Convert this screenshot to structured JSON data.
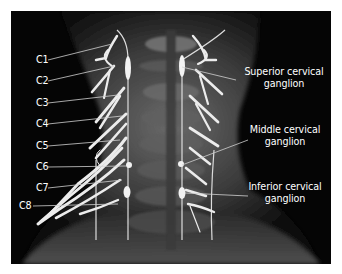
{
  "figure": {
    "panel_background": "#050505",
    "nerve_color": "#e8e8e8",
    "leader_color": "#d0d0d0",
    "label_color": "#ffffff"
  },
  "left_labels": [
    {
      "text": "C1",
      "x": 36,
      "y": 54,
      "line": [
        48,
        60,
        112,
        44
      ]
    },
    {
      "text": "C2",
      "x": 36,
      "y": 75,
      "line": [
        48,
        81,
        114,
        66
      ]
    },
    {
      "text": "C3",
      "x": 36,
      "y": 97,
      "line": [
        48,
        103,
        118,
        95
      ]
    },
    {
      "text": "C4",
      "x": 36,
      "y": 118,
      "line": [
        48,
        124,
        122,
        116
      ]
    },
    {
      "text": "C5",
      "x": 36,
      "y": 140,
      "line": [
        48,
        146,
        120,
        140
      ]
    },
    {
      "text": "C6",
      "x": 36,
      "y": 161,
      "line": [
        48,
        167,
        126,
        166
      ]
    },
    {
      "text": "C7",
      "x": 36,
      "y": 182,
      "line": [
        48,
        188,
        122,
        180
      ]
    },
    {
      "text": "C8",
      "x": 19,
      "y": 200,
      "line": [
        33,
        206,
        118,
        204
      ]
    }
  ],
  "right_labels": [
    {
      "lines": [
        "Superior cervical",
        "ganglion"
      ],
      "x": 242,
      "y": 66,
      "width": 84,
      "line": [
        236,
        80,
        182,
        67
      ]
    },
    {
      "lines": [
        "Middle cervical",
        "ganglion"
      ],
      "x": 245,
      "y": 124,
      "width": 80,
      "line": [
        248,
        140,
        182,
        165
      ]
    },
    {
      "lines": [
        "Inferior cervical",
        "ganglion"
      ],
      "x": 243,
      "y": 181,
      "width": 84,
      "line": [
        248,
        196,
        185,
        193
      ]
    }
  ]
}
